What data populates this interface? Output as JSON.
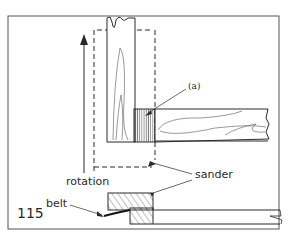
{
  "figure": {
    "number": "115",
    "labels": {
      "part_a": "(a)",
      "sander": "sander",
      "rotation": "rotation",
      "belt": "belt"
    }
  },
  "colors": {
    "line": "#2a2a2a",
    "frame": "#555555",
    "background": "#ffffff"
  }
}
